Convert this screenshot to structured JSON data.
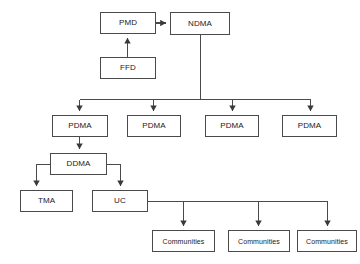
{
  "diagram": {
    "type": "organizational-flowchart",
    "background_color": "#ffffff",
    "line_color": "#4a4a4a",
    "text_color": "#1a1a1a",
    "nodes": [
      {
        "id": "pmd",
        "label": "PMD",
        "x": 100,
        "y": 12,
        "w": 56,
        "h": 22,
        "font_size": 8
      },
      {
        "id": "ndma",
        "label": "NDMA",
        "x": 170,
        "y": 12,
        "w": 60,
        "h": 23,
        "font_size": 8
      },
      {
        "id": "ffd",
        "label": "FFD",
        "x": 100,
        "y": 57,
        "w": 56,
        "h": 22,
        "font_size": 8
      },
      {
        "id": "pdma1",
        "label": "PDMA",
        "x": 52,
        "y": 115,
        "w": 56,
        "h": 22,
        "font_size": 8
      },
      {
        "id": "pdma2",
        "label": "PDMA",
        "x": 127,
        "y": 115,
        "w": 54,
        "h": 22,
        "font_size": 8
      },
      {
        "id": "pdma3",
        "label": "PDMA",
        "x": 205,
        "y": 115,
        "w": 54,
        "h": 22,
        "font_size": 8
      },
      {
        "id": "pdma4",
        "label": "PDMA",
        "x": 282,
        "y": 115,
        "w": 55,
        "h": 22,
        "font_size": 8
      },
      {
        "id": "ddma",
        "label": "DDMA",
        "x": 50,
        "y": 153,
        "w": 57,
        "h": 22,
        "font_size": 8
      },
      {
        "id": "tma",
        "label": "TMA",
        "x": 20,
        "y": 190,
        "w": 53,
        "h": 22,
        "font_size": 8
      },
      {
        "id": "uc",
        "label": "UC",
        "x": 92,
        "y": 190,
        "w": 56,
        "h": 22,
        "font_size": 8
      },
      {
        "id": "communities1",
        "label": "Communities",
        "x": 152,
        "y": 230,
        "w": 63,
        "h": 22,
        "font_size": 7
      },
      {
        "id": "communities2",
        "label": "Communities",
        "x": 228,
        "y": 230,
        "w": 62,
        "h": 22,
        "font_size": 7
      },
      {
        "id": "communities3",
        "label": "Communities",
        "x": 297,
        "y": 230,
        "w": 60,
        "h": 22,
        "font_size": 7
      }
    ],
    "edges": [
      {
        "id": "ffd-to-pmd",
        "from": "ffd",
        "to": "pmd",
        "arrow": "up"
      },
      {
        "id": "pmd-to-ndma",
        "from": "pmd",
        "to": "ndma",
        "arrow": "right"
      },
      {
        "id": "ndma-to-pdma1",
        "from": "ndma",
        "to": "pdma1",
        "arrow": "down"
      },
      {
        "id": "ndma-to-pdma2",
        "from": "ndma",
        "to": "pdma2",
        "arrow": "down"
      },
      {
        "id": "ndma-to-pdma3",
        "from": "ndma",
        "to": "pdma3",
        "arrow": "down"
      },
      {
        "id": "ndma-to-pdma4",
        "from": "ndma",
        "to": "pdma4",
        "arrow": "down"
      },
      {
        "id": "pdma1-to-ddma",
        "from": "pdma1",
        "to": "ddma",
        "arrow": "down"
      },
      {
        "id": "ddma-to-tma",
        "from": "ddma",
        "to": "tma",
        "arrow": "down"
      },
      {
        "id": "ddma-to-uc",
        "from": "ddma",
        "to": "uc",
        "arrow": "down"
      },
      {
        "id": "uc-to-communities1",
        "from": "uc",
        "to": "communities1",
        "arrow": "down"
      },
      {
        "id": "uc-to-communities2",
        "from": "uc",
        "to": "communities2",
        "arrow": "down"
      },
      {
        "id": "uc-to-communities3",
        "from": "uc",
        "to": "communities3",
        "arrow": "down"
      }
    ]
  }
}
